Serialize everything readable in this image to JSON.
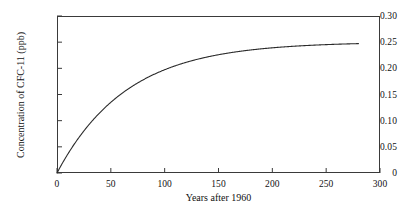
{
  "chart_data": {
    "type": "line",
    "title": "",
    "subtitle": "",
    "xlabel": "Years after 1960",
    "ylabel": "Concentration of CFC-11 (ppb)",
    "xlim": [
      0,
      300
    ],
    "ylim": [
      0,
      0.3
    ],
    "grid": false,
    "legend": null,
    "xticks": [
      0,
      50,
      100,
      150,
      200,
      250,
      300
    ],
    "xtick_labels": [
      "0",
      "50",
      "100",
      "150",
      "200",
      "250",
      "300"
    ],
    "yticks": [
      0,
      0.05,
      0.1,
      0.15,
      0.2,
      0.25,
      0.3
    ],
    "ytick_labels": [
      "0",
      "0.05",
      "0.10",
      "0.15",
      "0.20",
      "0.25",
      "0.30"
    ],
    "series": [
      {
        "name": "CFC-11 concentration",
        "color": "#2b2b2b",
        "line_width": 1.1,
        "x": [
          0,
          5,
          10,
          15,
          20,
          25,
          30,
          35,
          40,
          45,
          50,
          60,
          70,
          80,
          90,
          100,
          110,
          120,
          130,
          140,
          150,
          160,
          170,
          180,
          190,
          200,
          210,
          220,
          230,
          240,
          250,
          260,
          270,
          280
        ],
        "y": [
          0.0,
          0.0285,
          0.0529,
          0.0738,
          0.0917,
          0.107,
          0.1201,
          0.1313,
          0.1409,
          0.1491,
          0.1562,
          0.1675,
          0.1758,
          0.182,
          0.1866,
          0.19,
          0.1925,
          0.1944,
          0.1957,
          0.1967,
          0.1975,
          0.198,
          0.1984,
          0.1987,
          0.1989,
          0.1991,
          0.1992,
          0.1993,
          0.1993,
          0.1994,
          0.1994,
          0.1994,
          0.1995,
          0.1995
        ]
      }
    ],
    "curve_model": {
      "equation": "C(t) = L * (1 - exp(-k t))",
      "asymptote_L": 0.2505,
      "rate_k": 0.0155,
      "x_start": 0,
      "x_end": 280,
      "y_start": 0,
      "y_end": 0.2474
    },
    "annotations": []
  },
  "figure": {
    "background_color": "#ffffff",
    "frame_color": "#3a3a3a",
    "text_color": "#111111"
  }
}
